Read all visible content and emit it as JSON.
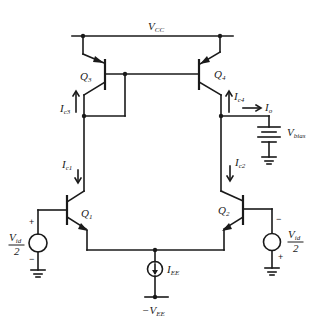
{
  "diagram": {
    "type": "circuit-schematic",
    "colors": {
      "ink": "#1a1a1a",
      "background": "#ffffff"
    },
    "supplies": {
      "positive": {
        "main": "V",
        "sub": "CC"
      },
      "negative": {
        "main": "−V",
        "sub": "EE"
      }
    },
    "transistors": [
      {
        "id": "Q3",
        "main": "Q",
        "sub": "3",
        "type": "pnp"
      },
      {
        "id": "Q4",
        "main": "Q",
        "sub": "4",
        "type": "pnp"
      },
      {
        "id": "Q1",
        "main": "Q",
        "sub": "1",
        "type": "npn"
      },
      {
        "id": "Q2",
        "main": "Q",
        "sub": "2",
        "type": "npn"
      }
    ],
    "currents": {
      "ic3": {
        "main": "I",
        "sub": "c3",
        "direction": "up"
      },
      "ic4": {
        "main": "I",
        "sub": "c4",
        "direction": "up"
      },
      "ic1": {
        "main": "I",
        "sub": "c1",
        "direction": "down"
      },
      "ic2": {
        "main": "I",
        "sub": "c2",
        "direction": "down"
      },
      "io": {
        "main": "I",
        "sub": "o",
        "direction": "right"
      },
      "iee": {
        "main": "I",
        "sub": "EE",
        "direction": "down"
      }
    },
    "sources": {
      "vbias": {
        "main": "V",
        "sub": "bias"
      },
      "vid_left": {
        "num": "V",
        "num_sub": "id",
        "den": "2",
        "top_sign": "+",
        "bottom_sign": "−"
      },
      "vid_right": {
        "num": "V",
        "num_sub": "id",
        "den": "2",
        "top_sign": "−",
        "bottom_sign": "+"
      }
    }
  }
}
